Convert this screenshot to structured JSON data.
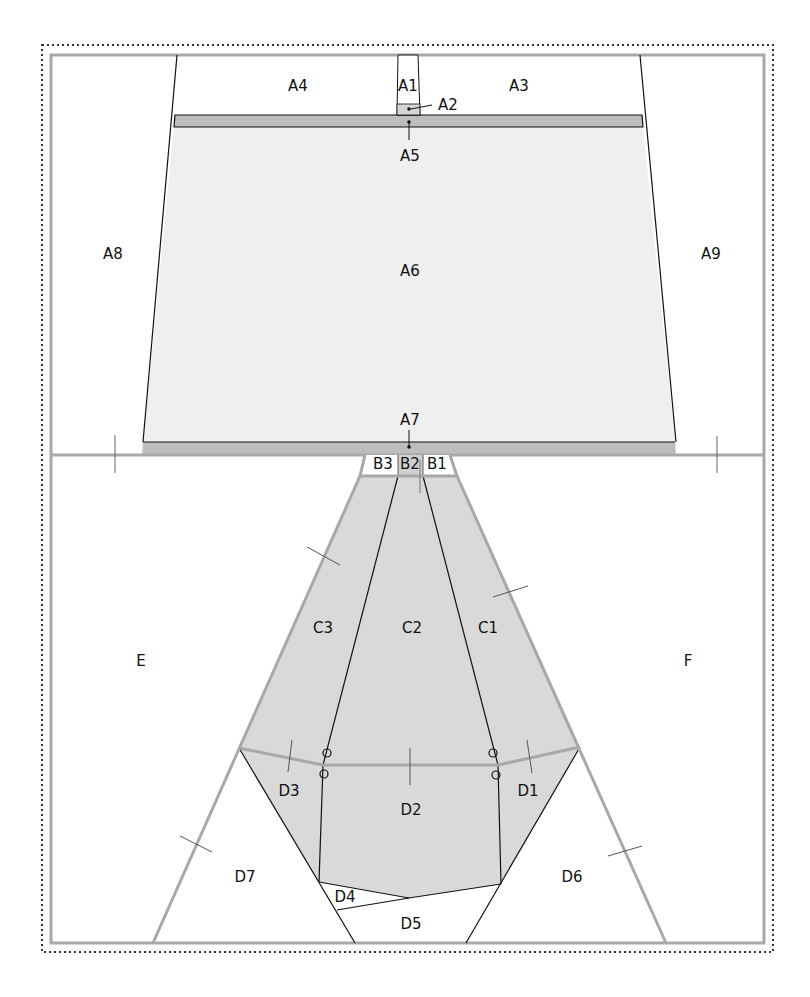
{
  "colors": {
    "frame_gray": "#a8a8a8",
    "light_fill": "#efefef",
    "band_fill": "#bdbdbd",
    "c_fill": "#d9d9d9",
    "line": "#111111"
  },
  "labels": {
    "A1": "A1",
    "A2": "A2",
    "A3": "A3",
    "A4": "A4",
    "A5": "A5",
    "A6": "A6",
    "A7": "A7",
    "A8": "A8",
    "A9": "A9",
    "B1": "B1",
    "B2": "B2",
    "B3": "B3",
    "C1": "C1",
    "C2": "C2",
    "C3": "C3",
    "D1": "D1",
    "D2": "D2",
    "D3": "D3",
    "D4": "D4",
    "D5": "D5",
    "D6": "D6",
    "D7": "D7",
    "E": "E",
    "F": "F"
  }
}
